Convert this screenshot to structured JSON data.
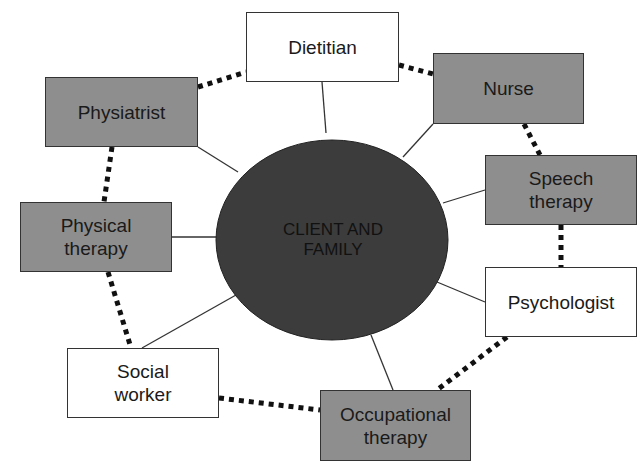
{
  "center": {
    "label_line1": "CLIENT AND",
    "label_line2": "FAMILY",
    "fill": "#3c3c3c"
  },
  "colors": {
    "gray_box": "#8e8e8e",
    "white_box": "#ffffff",
    "line": "#333333",
    "dots": "#111111"
  },
  "nodes": [
    {
      "id": "dietitian",
      "line1": "Dietitian",
      "line2": "",
      "style": "white"
    },
    {
      "id": "nurse",
      "line1": "Nurse",
      "line2": "",
      "style": "gray"
    },
    {
      "id": "speech-therapy",
      "line1": "Speech",
      "line2": "therapy",
      "style": "gray"
    },
    {
      "id": "psychologist",
      "line1": "Psychologist",
      "line2": "",
      "style": "white"
    },
    {
      "id": "occupational-therapy",
      "line1": "Occupational",
      "line2": "therapy",
      "style": "gray"
    },
    {
      "id": "social-worker",
      "line1": "Social",
      "line2": "worker",
      "style": "white"
    },
    {
      "id": "physical-therapy",
      "line1": "Physical",
      "line2": "therapy",
      "style": "gray"
    },
    {
      "id": "physiatrist",
      "line1": "Physiatrist",
      "line2": "",
      "style": "gray"
    }
  ],
  "connections": {
    "solid": "each node connects to CLIENT AND FAMILY",
    "dotted": "adjacent nodes connected in a ring"
  }
}
